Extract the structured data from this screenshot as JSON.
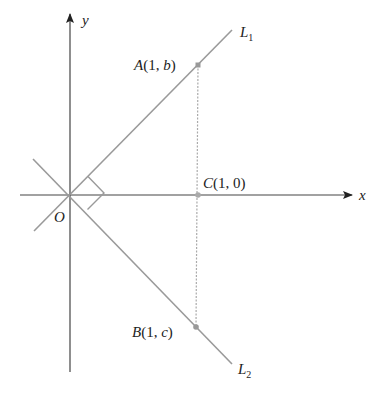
{
  "axes": {
    "x_label": "x",
    "y_label": "y",
    "origin_label": "O"
  },
  "lines": {
    "L1": {
      "name": "L",
      "sub": "1"
    },
    "L2": {
      "name": "L",
      "sub": "2"
    }
  },
  "points": {
    "A": {
      "name": "A",
      "coords": "(1, b)",
      "pre": "A(1, ",
      "var": "b",
      "post": ")"
    },
    "B": {
      "name": "B",
      "coords": "(1, c)",
      "pre": "B(1, ",
      "var": "c",
      "post": ")"
    },
    "C": {
      "name": "C",
      "coords": "(1, 0)",
      "pre": "C",
      "rest": "(1, 0)"
    }
  },
  "colors": {
    "axis": "#333333",
    "line": "#9a9a9a",
    "dashed": "#aaaaaa",
    "point": "#999999"
  }
}
